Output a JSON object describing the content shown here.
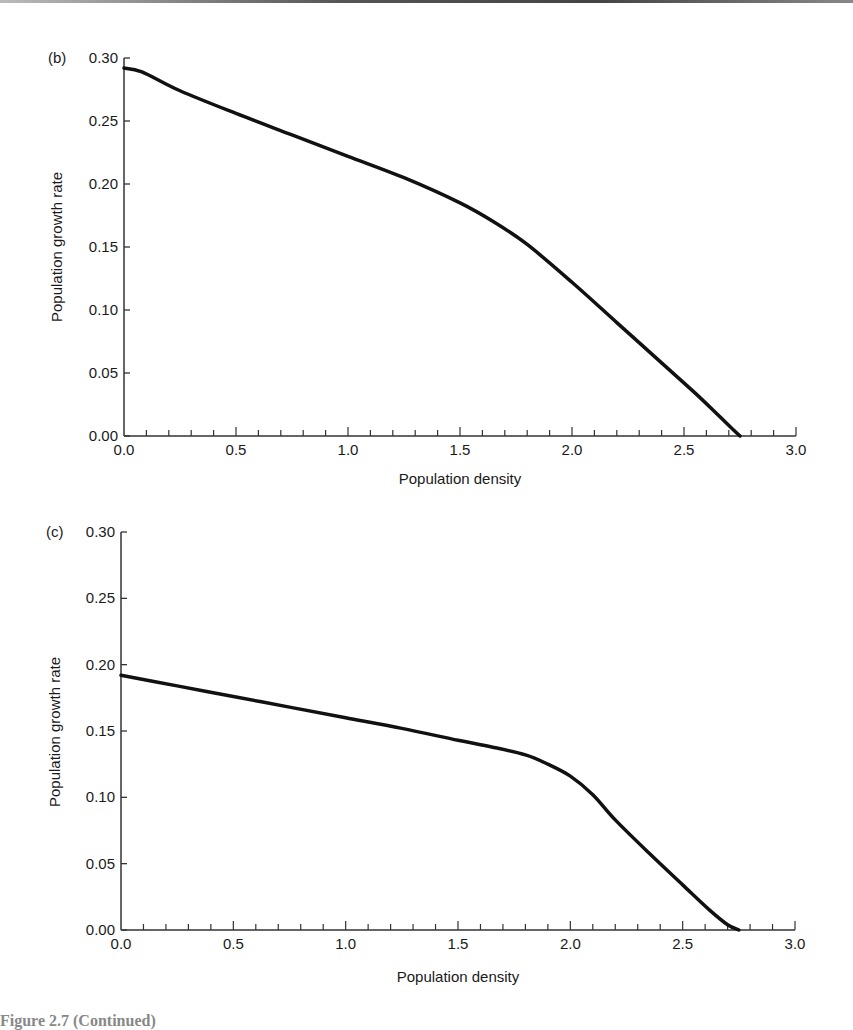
{
  "chart_data": [
    {
      "type": "line",
      "panel_label": "(b)",
      "title": "",
      "xlabel": "Population density",
      "ylabel": "Population growth rate",
      "xlim": [
        0.0,
        3.0
      ],
      "ylim": [
        0.0,
        0.3
      ],
      "x_ticks": [
        "0.0",
        "0.5",
        "1.0",
        "1.5",
        "2.0",
        "2.5",
        "3.0"
      ],
      "y_ticks": [
        "0.00",
        "0.05",
        "0.10",
        "0.15",
        "0.20",
        "0.25",
        "0.30"
      ],
      "x_minor_step": 0.1,
      "grid": false,
      "series": [
        {
          "name": "growth rate (b)",
          "x": [
            0.0,
            0.08,
            0.25,
            0.5,
            0.75,
            1.0,
            1.25,
            1.5,
            1.65,
            1.8,
            2.0,
            2.2,
            2.4,
            2.55,
            2.65,
            2.72,
            2.75
          ],
          "y": [
            0.292,
            0.289,
            0.274,
            0.256,
            0.239,
            0.222,
            0.205,
            0.185,
            0.17,
            0.152,
            0.122,
            0.09,
            0.058,
            0.034,
            0.017,
            0.005,
            0.0
          ]
        }
      ]
    },
    {
      "type": "line",
      "panel_label": "(c)",
      "title": "",
      "xlabel": "Population density",
      "ylabel": "Population growth rate",
      "xlim": [
        0.0,
        3.0
      ],
      "ylim": [
        0.0,
        0.3
      ],
      "x_ticks": [
        "0.0",
        "0.5",
        "1.0",
        "1.5",
        "2.0",
        "2.5",
        "3.0"
      ],
      "y_ticks": [
        "0.00",
        "0.05",
        "0.10",
        "0.15",
        "0.20",
        "0.25",
        "0.30"
      ],
      "x_minor_step": 0.1,
      "grid": false,
      "series": [
        {
          "name": "growth rate (c)",
          "x": [
            0.0,
            0.25,
            0.5,
            0.75,
            1.0,
            1.25,
            1.5,
            1.65,
            1.8,
            1.9,
            2.0,
            2.1,
            2.2,
            2.35,
            2.5,
            2.62,
            2.7,
            2.75
          ],
          "y": [
            0.192,
            0.184,
            0.176,
            0.168,
            0.16,
            0.152,
            0.143,
            0.138,
            0.132,
            0.125,
            0.116,
            0.102,
            0.083,
            0.058,
            0.034,
            0.015,
            0.004,
            0.0
          ]
        }
      ]
    }
  ],
  "caption": {
    "text": "Figure 2.7  (Continued)"
  }
}
